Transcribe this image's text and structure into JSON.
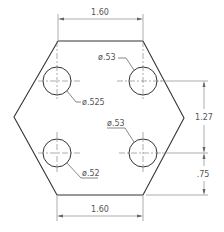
{
  "drawing": {
    "type": "engineering-drawing",
    "part": "hexagonal plate with four holes",
    "dimensions": {
      "top_width": "1.60",
      "bottom_width": "1.60",
      "hole_vertical_spacing": "1.27",
      "bottom_to_hole": ".75"
    },
    "holes": [
      {
        "position": "upper-left",
        "callout": "ø.525"
      },
      {
        "position": "upper-right",
        "callout": "ø.53"
      },
      {
        "position": "lower-left",
        "callout": "ø.52"
      },
      {
        "position": "lower-right",
        "callout": "ø.53"
      }
    ],
    "colors": {
      "outline": "#333333",
      "dimension": "#777777",
      "text": "#555555"
    }
  }
}
